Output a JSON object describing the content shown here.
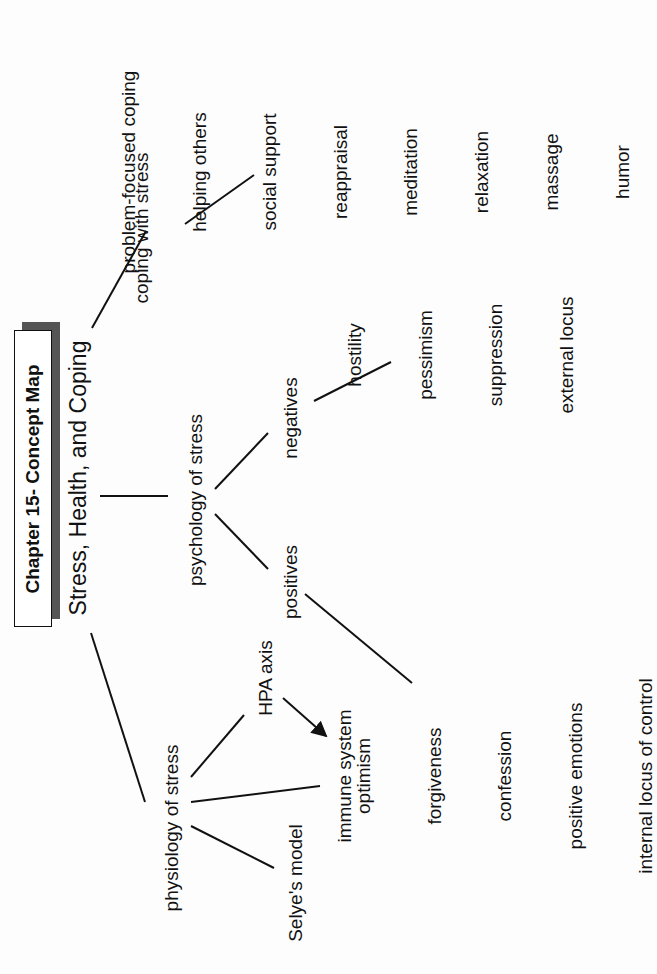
{
  "header": {
    "chapter_title": "Chapter 15- Concept Map",
    "main_topic": "Stress, Health, and Coping"
  },
  "branches": {
    "coping": {
      "label": "coping with stress",
      "items": [
        "problem-focused coping",
        "helping others",
        "social support",
        "reappraisal",
        "meditation",
        "relaxation",
        "massage",
        "humor"
      ]
    },
    "psychology": {
      "label": "psychology of stress",
      "negatives": {
        "label": "negatives",
        "items": [
          "hostility",
          "pessimism",
          "suppression",
          "external locus"
        ]
      },
      "positives": {
        "label": "positives",
        "items": [
          "optimism",
          "forgiveness",
          "confession",
          "positive emotions",
          "internal locus of control"
        ]
      }
    },
    "physiology": {
      "label": "physiology of stress",
      "hpa": "HPA axis",
      "immune": "immune system",
      "selye": "Selye's model"
    }
  },
  "colors": {
    "ink": "#111111",
    "paper": "#fdfdfd",
    "shadow": "#555555"
  }
}
